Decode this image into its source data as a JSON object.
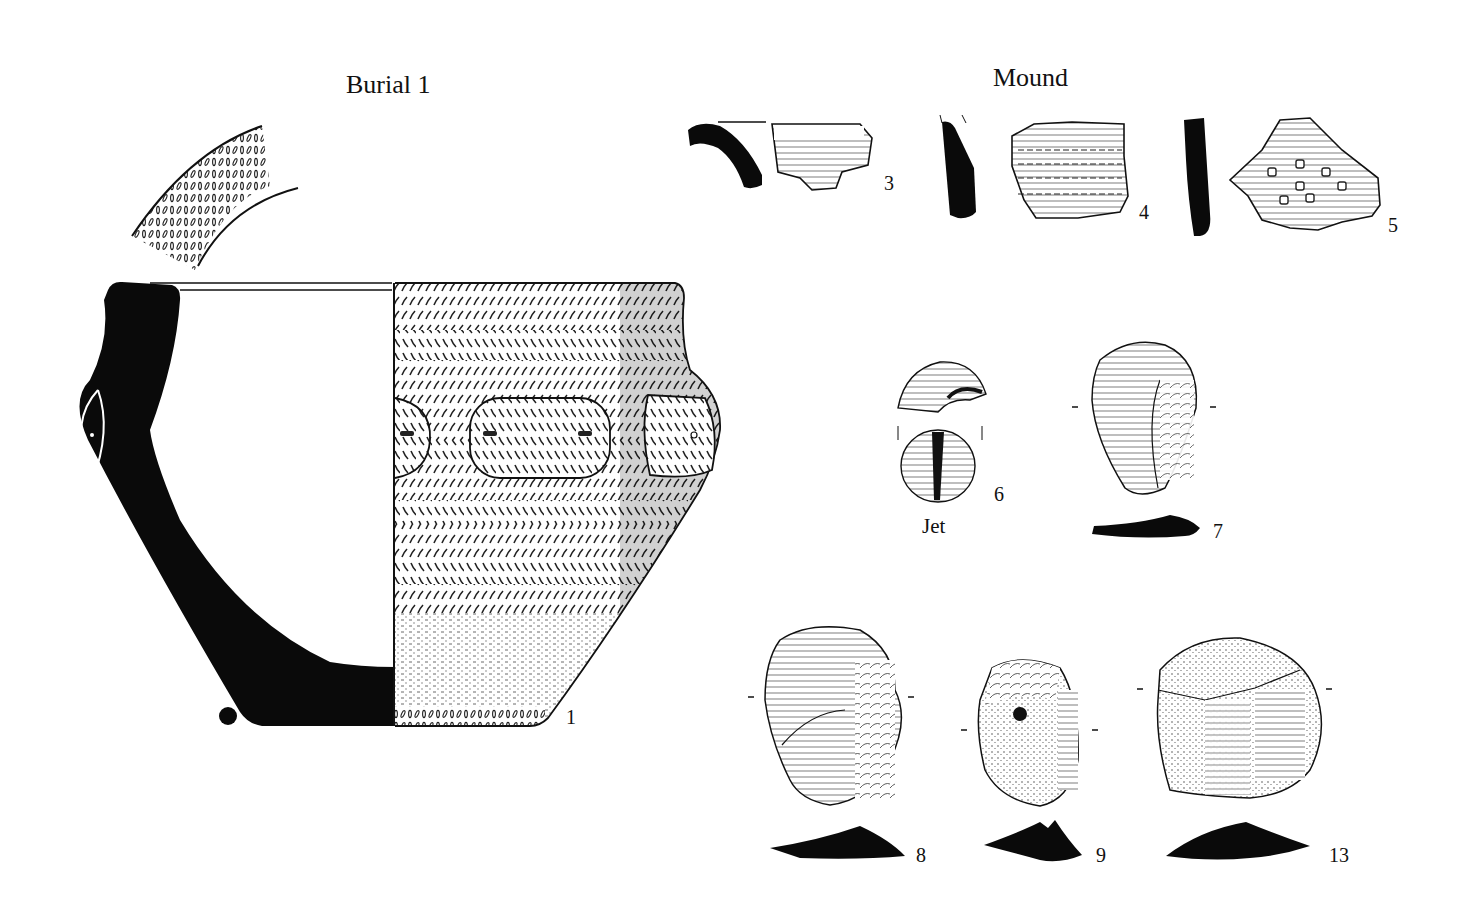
{
  "plate": {
    "background": "#ffffff",
    "ink": "#111111",
    "sections": [
      {
        "id": "burial",
        "heading": "Burial 1"
      },
      {
        "id": "mound",
        "heading": "Mound"
      }
    ],
    "artifacts": [
      {
        "number": "1",
        "section": "Burial 1",
        "kind": "decorated pot (profile + elevation), with rim-sherd detail"
      },
      {
        "number": "3",
        "section": "Mound",
        "kind": "rim sherd with section"
      },
      {
        "number": "4",
        "section": "Mound",
        "kind": "body sherd with section"
      },
      {
        "number": "5",
        "section": "Mound",
        "kind": "body sherd with section"
      },
      {
        "number": "6",
        "section": "Mound",
        "kind": "bead / button, two views",
        "material": "Jet"
      },
      {
        "number": "7",
        "section": "Mound",
        "kind": "flint flake with section"
      },
      {
        "number": "8",
        "section": "Mound",
        "kind": "flint scraper with section"
      },
      {
        "number": "9",
        "section": "Mound",
        "kind": "flint scraper with section"
      },
      {
        "number": "13",
        "section": "Mound",
        "kind": "flint core/scraper with section"
      }
    ]
  },
  "labels": {
    "burial_heading": "Burial 1",
    "mound_heading": "Mound",
    "n1": "1",
    "n3": "3",
    "n4": "4",
    "n5": "5",
    "n6": "6",
    "n7": "7",
    "n8": "8",
    "n9": "9",
    "n13": "13",
    "jet": "Jet"
  }
}
